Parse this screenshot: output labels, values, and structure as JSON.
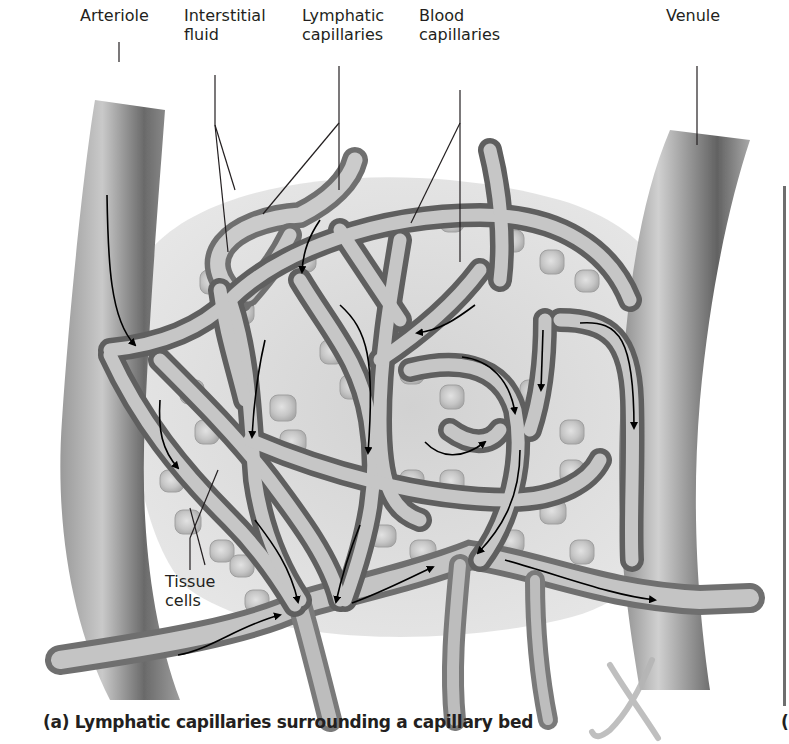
{
  "figure": {
    "caption": "(a) Lymphatic capillaries surrounding a capillary bed",
    "next_panel_caption_fragment": "(",
    "labels": {
      "arteriole": "Arteriole",
      "interstitial_fluid": "Interstitial\nfluid",
      "lymphatic_capillaries": "Lymphatic\ncapillaries",
      "blood_capillaries": "Blood\ncapillaries",
      "venule": "Venule",
      "tissue_cells": "Tissue\ncells"
    },
    "colors": {
      "vessel_dark": "#5a5a5a",
      "vessel_mid": "#8c8c8c",
      "vessel_light": "#d2d2d2",
      "cell_fill": "#c8c8c8",
      "arrow": "#000000",
      "leader_line": "#231f20",
      "watermark": "#b5b5b5"
    }
  }
}
